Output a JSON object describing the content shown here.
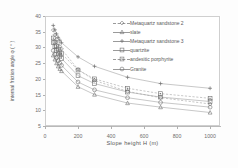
{
  "chart_data": {
    "type": "line",
    "title": "",
    "xlabel": "Slope height H (m)",
    "ylabel": "internal friction angle φ ( ° )",
    "xlim": [
      0,
      1060
    ],
    "ylim": [
      5,
      40
    ],
    "xticks": [
      0,
      200,
      400,
      600,
      800,
      1000
    ],
    "yticks": [
      5,
      10,
      15,
      20,
      25,
      30,
      35,
      40
    ],
    "grid": false,
    "legend_position": "top-right",
    "x": [
      50,
      60,
      70,
      80,
      90,
      100,
      200,
      300,
      500,
      700,
      1000
    ],
    "series": [
      {
        "name": "Metaquartz sandstone 2",
        "marker": "diamond",
        "line": "dashed",
        "values": [
          35.5,
          34.0,
          32.5,
          31.3,
          30.3,
          29.5,
          23.0,
          19.5,
          16.0,
          14.0,
          12.0
        ]
      },
      {
        "name": "slate",
        "marker": "triangle",
        "line": "solid",
        "values": [
          27.5,
          26.2,
          25.0,
          24.0,
          23.2,
          22.5,
          17.5,
          15.0,
          12.3,
          11.0,
          9.3
        ]
      },
      {
        "name": "Metaquartz sandstone 3",
        "marker": "plus",
        "line": "solid",
        "values": [
          37.0,
          35.6,
          34.3,
          33.2,
          32.3,
          31.5,
          27.0,
          24.0,
          20.5,
          18.5,
          17.0
        ]
      },
      {
        "name": "quartzite",
        "marker": "square",
        "line": "solid",
        "values": [
          31.5,
          30.2,
          29.0,
          28.0,
          27.2,
          26.5,
          21.0,
          18.5,
          15.8,
          14.2,
          12.8
        ]
      },
      {
        "name": "andesitic porphyrite",
        "marker": "square-dot",
        "line": "dashed",
        "values": [
          33.0,
          31.7,
          30.5,
          29.5,
          28.6,
          28.0,
          22.8,
          20.0,
          17.0,
          15.3,
          13.8
        ]
      },
      {
        "name": "Granite",
        "marker": "circle",
        "line": "solid",
        "values": [
          29.0,
          27.8,
          26.7,
          25.8,
          25.0,
          24.3,
          19.0,
          16.5,
          14.0,
          12.5,
          11.0
        ]
      }
    ]
  },
  "legend": {
    "items": [
      {
        "label": "Metaquartz sandstone 2"
      },
      {
        "label": "slate"
      },
      {
        "label": "Metaquartz sandstone 3"
      },
      {
        "label": "quartzite"
      },
      {
        "label": "andesitic porphyrite"
      },
      {
        "label": "Granite"
      }
    ]
  },
  "axes": {
    "x_title": "Slope height H (m)",
    "y_title": "internal friction angle φ ( ° )",
    "x_tick_labels": [
      "0",
      "200",
      "400",
      "600",
      "800",
      "1000"
    ],
    "y_tick_labels": [
      "5",
      "10",
      "15",
      "20",
      "25",
      "30",
      "35",
      "40"
    ]
  },
  "colors": {
    "line": "#9a9a9a",
    "marker": "#6f6f6f",
    "axis": "#b0b0b0",
    "text": "#5a5a5a",
    "background": "#ffffff"
  }
}
